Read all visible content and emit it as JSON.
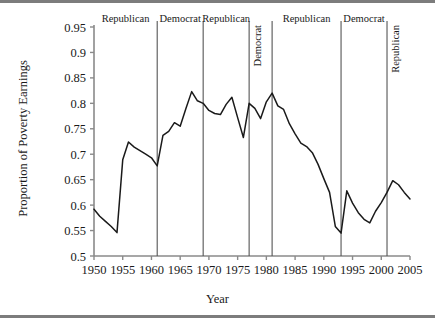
{
  "chart_data": {
    "type": "line",
    "title": "",
    "xlabel": "Year",
    "ylabel": "Proportion of Poverty Earnings",
    "xlim": [
      1950,
      2005
    ],
    "ylim": [
      0.5,
      0.95
    ],
    "grid": false,
    "legend": "none",
    "xticks": [
      1950,
      1955,
      1960,
      1965,
      1970,
      1975,
      1980,
      1985,
      1990,
      1995,
      2000,
      2005
    ],
    "xtick_labels": [
      "1950",
      "1955",
      "1960",
      "1965",
      "1970",
      "1975",
      "1980",
      "1985",
      "1990",
      "1995",
      "2000",
      "2005"
    ],
    "yticks": [
      0.5,
      0.55,
      0.6,
      0.65,
      0.7,
      0.75,
      0.8,
      0.85,
      0.9,
      0.95
    ],
    "ytick_labels": [
      "0.5",
      "0.55",
      "0.6",
      "0.65",
      "0.7",
      "0.75",
      "0.8",
      "0.85",
      "0.9",
      "0.95"
    ],
    "series": [
      {
        "name": "Proportion of Poverty Earnings",
        "color": "#1a1a1a",
        "x": [
          1950,
          1951,
          1952,
          1953,
          1954,
          1955,
          1956,
          1957,
          1958,
          1959,
          1960,
          1961,
          1962,
          1963,
          1964,
          1965,
          1966,
          1967,
          1968,
          1969,
          1970,
          1971,
          1972,
          1973,
          1974,
          1975,
          1976,
          1977,
          1978,
          1979,
          1980,
          1981,
          1982,
          1983,
          1984,
          1985,
          1986,
          1987,
          1988,
          1989,
          1990,
          1991,
          1992,
          1993,
          1994,
          1995,
          1996,
          1997,
          1998,
          1999,
          2000,
          2001,
          2002,
          2003,
          2004,
          2005
        ],
        "values": [
          0.592,
          0.578,
          0.568,
          0.558,
          0.546,
          0.689,
          0.724,
          0.714,
          0.707,
          0.7,
          0.693,
          0.677,
          0.737,
          0.745,
          0.762,
          0.755,
          0.79,
          0.823,
          0.805,
          0.8,
          0.786,
          0.78,
          0.778,
          0.798,
          0.812,
          0.772,
          0.733,
          0.8,
          0.79,
          0.77,
          0.803,
          0.82,
          0.795,
          0.788,
          0.76,
          0.74,
          0.722,
          0.715,
          0.703,
          0.68,
          0.652,
          0.625,
          0.558,
          0.545,
          0.628,
          0.604,
          0.585,
          0.572,
          0.565,
          0.588,
          0.605,
          0.625,
          0.648,
          0.64,
          0.625,
          0.612
        ],
        "description": "Proportion of poverty earnings in U.S., 1950-2005"
      }
    ],
    "eras": [
      {
        "label": "Republican",
        "start": 1950,
        "end": 1961,
        "orientation": "horizontal"
      },
      {
        "label": "Democrat",
        "start": 1961,
        "end": 1969,
        "orientation": "horizontal"
      },
      {
        "label": "Republican",
        "start": 1969,
        "end": 1977,
        "orientation": "horizontal"
      },
      {
        "label": "Democrat",
        "start": 1977,
        "end": 1981,
        "orientation": "vertical"
      },
      {
        "label": "Republican",
        "start": 1981,
        "end": 1993,
        "orientation": "horizontal"
      },
      {
        "label": "Democrat",
        "start": 1993,
        "end": 2001,
        "orientation": "horizontal"
      },
      {
        "label": "Republican",
        "start": 2001,
        "end": 2005,
        "orientation": "vertical"
      }
    ],
    "era_divider_years": [
      1961,
      1969,
      1977,
      1981,
      1993,
      2001
    ],
    "axis_color": "#8a8a8a",
    "line_color": "#1a1a1a",
    "divider_color": "#555555",
    "background": "#ffffff"
  },
  "figure": {
    "x_axis_title": "Year",
    "y_axis_title": "Proportion of Poverty Earnings"
  }
}
